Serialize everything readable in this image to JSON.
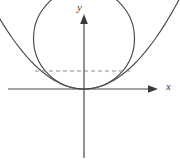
{
  "figure": {
    "background_color": "#ffffff",
    "width": 180,
    "height": 164
  },
  "axes": {
    "x_axis": {
      "label": "x",
      "color": "#4a4a4a",
      "arrow": "right-arrow-icon",
      "y_pixel": 89,
      "x_start": 8,
      "x_end": 158
    },
    "y_axis": {
      "label": "y",
      "color": "#4a4a4a",
      "arrow": "up-arrow-icon",
      "x_pixel": 84,
      "y_start": 158,
      "y_end": 14
    },
    "origin": {
      "label": "",
      "x_pixel": 84,
      "y_pixel": 89
    }
  },
  "chart_data": {
    "type": "line",
    "title": "",
    "xlabel": "x",
    "ylabel": "y",
    "grid": false,
    "legend": null,
    "xlim": [
      -1.52,
      1.52
    ],
    "ylim": [
      -1.02,
      1.52
    ],
    "series": [
      {
        "name": "circle",
        "kind": "circle",
        "curve_color": "#4a4a4a",
        "center": [
          0,
          0.5
        ],
        "radius": 0.5,
        "note": "tangent to x-axis at the origin",
        "pixel_center": [
          84,
          38.5
        ],
        "pixel_radius": 50.5
      },
      {
        "name": "parabola",
        "kind": "parabola",
        "curve_color": "#4a4a4a",
        "equation": "y = x^2",
        "vertex": [
          0,
          0
        ],
        "opens": "up",
        "x_range": [
          -1.5,
          1.5
        ],
        "note": "vertex at the origin, opening upward"
      },
      {
        "name": "chord",
        "kind": "dashed-segment",
        "curve_color": "#8c8c8c",
        "dash": "4 3",
        "y_value": 0.3536,
        "x_from": -0.4858,
        "x_to": 0.4858,
        "pixel_y": 71,
        "pixel_x_from": 35,
        "pixel_x_to": 133,
        "note": "horizontal dashed line joining the two curve intersections"
      }
    ],
    "intersections": [
      {
        "name": "left-intersection",
        "pixel": [
          35,
          71
        ]
      },
      {
        "name": "right-intersection",
        "pixel": [
          133,
          71
        ]
      },
      {
        "name": "origin-tangency",
        "pixel": [
          84,
          89
        ]
      }
    ]
  }
}
